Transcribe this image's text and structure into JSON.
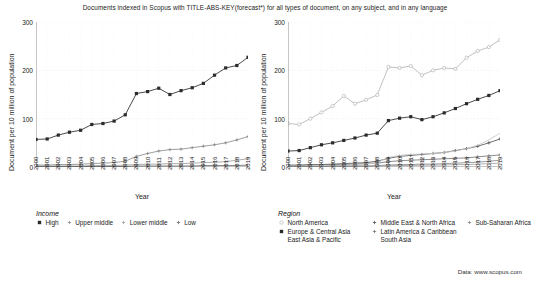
{
  "title": "Documents indexed in Scopus with TITLE-ABS-KEY(forecast*) for all types of document, on any subject, and in any language",
  "source_note": "Data: www.scopus.com",
  "axes": {
    "ylabel": "Document per 10 million of population",
    "xlabel": "Year",
    "yticks": [
      "0",
      "100",
      "200",
      "300"
    ],
    "ylim": [
      0,
      300
    ],
    "xticks": [
      "2000",
      "2001",
      "2002",
      "2003",
      "2004",
      "2005",
      "2006",
      "2007",
      "2008",
      "2009",
      "2010",
      "2011",
      "2012",
      "2013",
      "2014",
      "2015",
      "2016",
      "2017",
      "2018",
      "2019"
    ]
  },
  "legends": {
    "income": {
      "title": "Income",
      "items": [
        {
          "label": "High",
          "color": "#2b2b2b",
          "marker": "square-filled"
        },
        {
          "label": "Upper middle",
          "color": "#8c8c8c",
          "marker": "plus"
        },
        {
          "label": "Lower middle",
          "color": "#9e9e9e",
          "marker": "plus"
        },
        {
          "label": "Low",
          "color": "#6e6e6e",
          "marker": "plus"
        }
      ]
    },
    "region": {
      "title": "Region",
      "items": [
        {
          "label": "North America",
          "color": "#b5b5b5",
          "marker": "circle-open"
        },
        {
          "label": "Middle East & North Africa",
          "color": "#555555",
          "marker": "plus"
        },
        {
          "label": "Sub-Saharan Africa",
          "color": "#8a8a8a",
          "marker": "plus"
        },
        {
          "label": "Europe & Central Asia",
          "color": "#2b2b2b",
          "marker": "square-filled"
        },
        {
          "label": "Latin America & Caribbean",
          "color": "#777777",
          "marker": "plus"
        },
        {
          "label": "East Asia & Pacific",
          "color": "#c9c9c9",
          "marker": "line"
        },
        {
          "label": "South Asia",
          "color": "#a0a0a0",
          "marker": "line"
        }
      ]
    }
  },
  "chart_data": [
    {
      "type": "line",
      "id": "by-income",
      "title": "",
      "xlabel": "Year",
      "ylabel": "Document per 10 million of population",
      "ylim": [
        0,
        300
      ],
      "grid": true,
      "legend_position": "below",
      "x": [
        2000,
        2001,
        2002,
        2003,
        2004,
        2005,
        2006,
        2007,
        2008,
        2009,
        2010,
        2011,
        2012,
        2013,
        2014,
        2015,
        2016,
        2017,
        2018,
        2019
      ],
      "series": [
        {
          "name": "High",
          "color": "#2b2b2b",
          "values": [
            57,
            58,
            66,
            72,
            76,
            88,
            90,
            95,
            108,
            152,
            156,
            163,
            150,
            158,
            164,
            173,
            190,
            205,
            210,
            227,
            255
          ]
        },
        {
          "name": "Upper middle",
          "color": "#8c8c8c",
          "values": [
            4,
            4,
            5,
            5,
            6,
            7,
            8,
            9,
            12,
            22,
            28,
            33,
            36,
            37,
            40,
            43,
            46,
            50,
            56,
            63,
            70
          ]
        },
        {
          "name": "Lower middle",
          "color": "#9e9e9e",
          "values": [
            2,
            2,
            2,
            2,
            2,
            3,
            3,
            3,
            4,
            5,
            6,
            6,
            7,
            7,
            8,
            9,
            10,
            11,
            14,
            17,
            20
          ]
        },
        {
          "name": "Low",
          "color": "#6e6e6e",
          "values": [
            1,
            1,
            1,
            1,
            1,
            1,
            1,
            1,
            1,
            2,
            2,
            2,
            2,
            2,
            2,
            3,
            3,
            3,
            3,
            4,
            4
          ]
        }
      ]
    },
    {
      "type": "line",
      "id": "by-region",
      "title": "",
      "xlabel": "Year",
      "ylabel": "Document per 10 million of population",
      "ylim": [
        0,
        300
      ],
      "grid": true,
      "legend_position": "below",
      "x": [
        2000,
        2001,
        2002,
        2003,
        2004,
        2005,
        2006,
        2007,
        2008,
        2009,
        2010,
        2011,
        2012,
        2013,
        2014,
        2015,
        2016,
        2017,
        2018,
        2019
      ],
      "series": [
        {
          "name": "North America",
          "color": "#b5b5b5",
          "values": [
            90,
            88,
            100,
            113,
            126,
            147,
            131,
            139,
            149,
            207,
            205,
            209,
            190,
            200,
            205,
            203,
            226,
            240,
            248,
            263,
            285
          ]
        },
        {
          "name": "Europe & Central Asia",
          "color": "#2b2b2b",
          "values": [
            33,
            34,
            40,
            46,
            50,
            55,
            60,
            66,
            70,
            96,
            101,
            104,
            98,
            104,
            112,
            121,
            131,
            140,
            148,
            158,
            172,
            194
          ]
        },
        {
          "name": "Middle East & North Africa",
          "color": "#555555",
          "values": [
            4,
            4,
            5,
            5,
            6,
            7,
            8,
            9,
            12,
            18,
            22,
            24,
            26,
            28,
            30,
            34,
            38,
            43,
            50,
            58,
            65
          ]
        },
        {
          "name": "Latin America & Caribbean",
          "color": "#777777",
          "values": [
            3,
            3,
            4,
            4,
            5,
            5,
            6,
            7,
            8,
            11,
            13,
            14,
            15,
            16,
            17,
            18,
            19,
            21,
            23,
            25,
            27
          ]
        },
        {
          "name": "East Asia & Pacific",
          "color": "#c9c9c9",
          "values": [
            2,
            2,
            2,
            3,
            3,
            4,
            5,
            6,
            9,
            20,
            24,
            26,
            27,
            28,
            30,
            33,
            38,
            45,
            56,
            70,
            88
          ]
        },
        {
          "name": "Sub-Saharan Africa",
          "color": "#8a8a8a",
          "values": [
            1,
            1,
            1,
            1,
            2,
            2,
            2,
            2,
            3,
            4,
            5,
            5,
            6,
            6,
            7,
            8,
            9,
            10,
            12,
            14,
            16
          ]
        },
        {
          "name": "South Asia",
          "color": "#a0a0a0",
          "values": [
            1,
            1,
            1,
            1,
            1,
            1,
            2,
            2,
            2,
            3,
            3,
            3,
            4,
            4,
            4,
            5,
            5,
            6,
            7,
            8,
            9
          ]
        }
      ]
    }
  ]
}
